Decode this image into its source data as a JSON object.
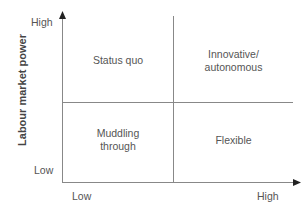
{
  "diagram": {
    "type": "2x2 quadrant matrix",
    "y_axis": {
      "label": "Labour market power",
      "high": "High",
      "low": "Low"
    },
    "x_axis": {
      "label": "",
      "low": "Low",
      "high": "High"
    },
    "quadrants": {
      "top_left": "Status quo",
      "top_right_line1": "Innovative/",
      "top_right_line2": "autonomous",
      "bottom_left_line1": "Muddling",
      "bottom_left_line2": "through",
      "bottom_right": "Flexible"
    },
    "colors": {
      "line": "#888888",
      "axis": "#777777",
      "arrow": "#222222",
      "text": "#555555"
    }
  }
}
